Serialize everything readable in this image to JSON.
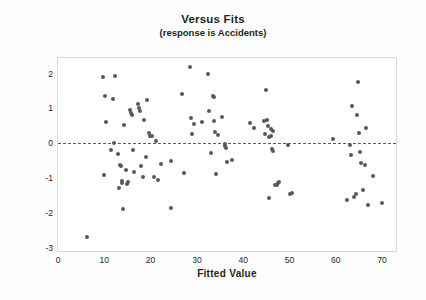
{
  "chart_data": {
    "type": "scatter",
    "title": "Versus Fits",
    "subtitle": "(response is Accidents)",
    "xlabel": "Fitted Value",
    "ylabel": "Standardized Residual",
    "xlim": [
      0,
      73
    ],
    "ylim": [
      -3.1,
      2.45
    ],
    "xticks": [
      0,
      10,
      20,
      30,
      40,
      50,
      60,
      70
    ],
    "yticks": [
      2,
      1,
      0,
      -1,
      -2,
      -3
    ],
    "xtick_labels": [
      "0",
      "10",
      "20",
      "30",
      "40",
      "50",
      "60",
      "70"
    ],
    "ytick_labels": [
      "2",
      "1",
      "0",
      "-1",
      "-2",
      "-3"
    ],
    "grid": false,
    "legend": "none",
    "reference_line": {
      "orientation": "horizontal",
      "value": 0,
      "style": "dashed",
      "color": "#58595b"
    },
    "marker": {
      "shape": "circle",
      "color": "#58595b",
      "size": 4
    },
    "series": [
      {
        "name": "Standardized Residual vs Fitted Value",
        "points": [
          [
            6.2,
            -2.7
          ],
          [
            9.8,
            1.89
          ],
          [
            10.1,
            1.35
          ],
          [
            10.3,
            0.61
          ],
          [
            10.0,
            -0.91
          ],
          [
            11.5,
            -0.19
          ],
          [
            11.9,
            1.26
          ],
          [
            12.2,
            0.01
          ],
          [
            12.3,
            1.92
          ],
          [
            13.0,
            -0.31
          ],
          [
            13.2,
            -1.28
          ],
          [
            13.3,
            -0.62
          ],
          [
            13.6,
            -0.67
          ],
          [
            13.8,
            -1.15
          ],
          [
            13.9,
            -1.1
          ],
          [
            14.0,
            -1.88
          ],
          [
            14.3,
            0.52
          ],
          [
            14.7,
            -0.78
          ],
          [
            15.0,
            -1.18
          ],
          [
            15.2,
            -1.12
          ],
          [
            15.6,
            0.95
          ],
          [
            15.8,
            0.88
          ],
          [
            16.0,
            0.8
          ],
          [
            16.3,
            -0.19
          ],
          [
            16.5,
            -0.84
          ],
          [
            17.2,
            1.12
          ],
          [
            17.5,
            1.02
          ],
          [
            17.8,
            0.93
          ],
          [
            18.0,
            -0.66
          ],
          [
            18.3,
            -0.97
          ],
          [
            18.6,
            0.66
          ],
          [
            18.9,
            -0.41
          ],
          [
            19.2,
            1.23
          ],
          [
            19.6,
            0.29
          ],
          [
            19.9,
            0.2
          ],
          [
            20.3,
            0.22
          ],
          [
            20.7,
            -0.97
          ],
          [
            21.2,
            0.06
          ],
          [
            21.6,
            -1.06
          ],
          [
            22.2,
            -0.6
          ],
          [
            24.3,
            -0.5
          ],
          [
            24.5,
            -1.87
          ],
          [
            26.8,
            1.42
          ],
          [
            27.2,
            -0.87
          ],
          [
            28.5,
            2.19
          ],
          [
            28.8,
            0.72
          ],
          [
            29.0,
            0.27
          ],
          [
            29.4,
            0.54
          ],
          [
            31.0,
            0.62
          ],
          [
            32.3,
            2.0
          ],
          [
            32.6,
            0.93
          ],
          [
            33.0,
            -0.27
          ],
          [
            33.4,
            1.37
          ],
          [
            33.6,
            1.32
          ],
          [
            33.8,
            0.65
          ],
          [
            33.9,
            0.31
          ],
          [
            34.1,
            -0.9
          ],
          [
            34.6,
            0.24
          ],
          [
            35.5,
            0.74
          ],
          [
            36.0,
            -0.03
          ],
          [
            36.1,
            -0.09
          ],
          [
            36.3,
            -0.14
          ],
          [
            36.6,
            -0.53
          ],
          [
            37.5,
            -0.49
          ],
          [
            41.5,
            0.59
          ],
          [
            42.3,
            0.43
          ],
          [
            44.5,
            0.65
          ],
          [
            44.8,
            0.27
          ],
          [
            45.0,
            1.54
          ],
          [
            45.2,
            0.66
          ],
          [
            45.3,
            0.5
          ],
          [
            45.5,
            0.17
          ],
          [
            45.6,
            -1.59
          ],
          [
            45.9,
            0.4
          ],
          [
            46.0,
            0.2
          ],
          [
            46.2,
            -0.17
          ],
          [
            46.4,
            -0.23
          ],
          [
            46.5,
            0.35
          ],
          [
            46.9,
            -1.19
          ],
          [
            47.2,
            -1.2
          ],
          [
            47.5,
            -1.14
          ],
          [
            47.7,
            -1.12
          ],
          [
            49.7,
            -0.04
          ],
          [
            50.2,
            -1.47
          ],
          [
            50.6,
            -1.43
          ],
          [
            59.3,
            0.13
          ],
          [
            62.5,
            -1.64
          ],
          [
            63.0,
            -0.06
          ],
          [
            63.3,
            -0.33
          ],
          [
            63.6,
            1.06
          ],
          [
            64.0,
            -1.54
          ],
          [
            64.3,
            -1.45
          ],
          [
            64.6,
            0.8
          ],
          [
            64.9,
            1.77
          ],
          [
            65.1,
            0.28
          ],
          [
            65.3,
            -0.24
          ],
          [
            65.4,
            -0.58
          ],
          [
            65.8,
            -1.36
          ],
          [
            66.3,
            -0.64
          ],
          [
            66.6,
            0.45
          ],
          [
            67.0,
            -1.78
          ],
          [
            68.0,
            -0.93
          ],
          [
            70.0,
            -1.72
          ]
        ]
      }
    ]
  }
}
